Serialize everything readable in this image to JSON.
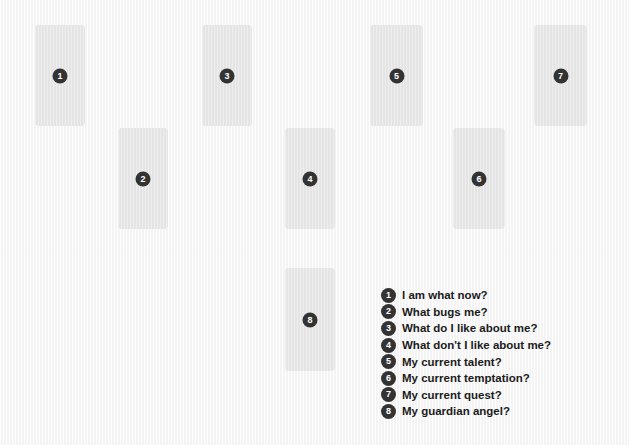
{
  "diagram": {
    "background_color": "#f7f7f7",
    "card_color": "#e7e7e7",
    "badge_color": "#333333",
    "badge_text_color": "#ffffff",
    "label_color": "#1b1b1b"
  },
  "cards": [
    {
      "number": "1",
      "x": 35,
      "y": 25,
      "w": 50,
      "h": 101
    },
    {
      "number": "2",
      "x": 118,
      "y": 128,
      "w": 50,
      "h": 101
    },
    {
      "number": "3",
      "x": 202,
      "y": 25,
      "w": 50,
      "h": 101
    },
    {
      "number": "4",
      "x": 285,
      "y": 128,
      "w": 50,
      "h": 101
    },
    {
      "number": "5",
      "x": 370,
      "y": 25,
      "w": 53,
      "h": 101
    },
    {
      "number": "6",
      "x": 453,
      "y": 128,
      "w": 52,
      "h": 101
    },
    {
      "number": "7",
      "x": 534,
      "y": 25,
      "w": 53,
      "h": 101
    },
    {
      "number": "8",
      "x": 285,
      "y": 268,
      "w": 50,
      "h": 103
    }
  ],
  "legend": {
    "items": [
      {
        "number": "1",
        "label": "I am what now?"
      },
      {
        "number": "2",
        "label": "What bugs me?"
      },
      {
        "number": "3",
        "label": "What do I like about me?"
      },
      {
        "number": "4",
        "label": "What don't I like about me?"
      },
      {
        "number": "5",
        "label": "My current talent?"
      },
      {
        "number": "6",
        "label": "My current temptation?"
      },
      {
        "number": "7",
        "label": "My current quest?"
      },
      {
        "number": "8",
        "label": "My guardian angel?"
      }
    ]
  }
}
